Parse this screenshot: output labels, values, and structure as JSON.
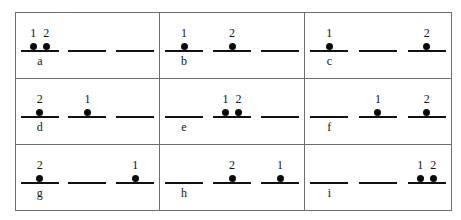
{
  "figure": {
    "type": "orbital-occupancy-diagram-grid",
    "rows": 3,
    "columns": 3,
    "orbitals_per_cell": 3,
    "particles": [
      "1",
      "2"
    ],
    "colors": {
      "line": "#111111",
      "electron": "#0a0a0a",
      "border": "#6e6e6e",
      "background": "#ffffff"
    },
    "cells": [
      {
        "letter": "a",
        "orbitals": [
          {
            "electrons": [
              {
                "index": "1",
                "slot": "left"
              },
              {
                "index": "2",
                "slot": "right"
              }
            ]
          },
          {
            "electrons": []
          },
          {
            "electrons": []
          }
        ]
      },
      {
        "letter": "b",
        "orbitals": [
          {
            "electrons": [
              {
                "index": "1",
                "slot": "single"
              }
            ]
          },
          {
            "electrons": [
              {
                "index": "2",
                "slot": "single"
              }
            ]
          },
          {
            "electrons": []
          }
        ]
      },
      {
        "letter": "c",
        "orbitals": [
          {
            "electrons": [
              {
                "index": "1",
                "slot": "single"
              }
            ]
          },
          {
            "electrons": []
          },
          {
            "electrons": [
              {
                "index": "2",
                "slot": "single"
              }
            ]
          }
        ]
      },
      {
        "letter": "d",
        "orbitals": [
          {
            "electrons": [
              {
                "index": "2",
                "slot": "single"
              }
            ]
          },
          {
            "electrons": [
              {
                "index": "1",
                "slot": "single"
              }
            ]
          },
          {
            "electrons": []
          }
        ]
      },
      {
        "letter": "e",
        "orbitals": [
          {
            "electrons": []
          },
          {
            "electrons": [
              {
                "index": "1",
                "slot": "left"
              },
              {
                "index": "2",
                "slot": "right"
              }
            ]
          },
          {
            "electrons": []
          }
        ]
      },
      {
        "letter": "f",
        "orbitals": [
          {
            "electrons": []
          },
          {
            "electrons": [
              {
                "index": "1",
                "slot": "single"
              }
            ]
          },
          {
            "electrons": [
              {
                "index": "2",
                "slot": "single"
              }
            ]
          }
        ]
      },
      {
        "letter": "g",
        "orbitals": [
          {
            "electrons": [
              {
                "index": "2",
                "slot": "single"
              }
            ]
          },
          {
            "electrons": []
          },
          {
            "electrons": [
              {
                "index": "1",
                "slot": "single"
              }
            ]
          }
        ]
      },
      {
        "letter": "h",
        "orbitals": [
          {
            "electrons": []
          },
          {
            "electrons": [
              {
                "index": "2",
                "slot": "single"
              }
            ]
          },
          {
            "electrons": [
              {
                "index": "1",
                "slot": "single"
              }
            ]
          }
        ]
      },
      {
        "letter": "i",
        "orbitals": [
          {
            "electrons": []
          },
          {
            "electrons": []
          },
          {
            "electrons": [
              {
                "index": "1",
                "slot": "left"
              },
              {
                "index": "2",
                "slot": "right"
              }
            ]
          }
        ]
      }
    ]
  }
}
